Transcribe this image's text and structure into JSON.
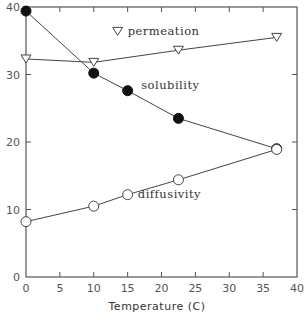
{
  "chart_data": {
    "type": "line",
    "title": "",
    "xlabel": "Temperature (C)",
    "ylabel": "",
    "xlim": [
      0,
      40
    ],
    "ylim": [
      0,
      40
    ],
    "xticks": [
      0,
      5,
      10,
      15,
      20,
      25,
      30,
      35,
      40
    ],
    "yticks": [
      0,
      10,
      20,
      30,
      40
    ],
    "grid": false,
    "legend": "inline labels",
    "series": [
      {
        "name": "permeation",
        "marker": "open-down-triangle",
        "x": [
          0,
          10,
          22.5,
          37
        ],
        "values": [
          32.3,
          31.8,
          33.6,
          35.5
        ],
        "label_pos": [
          15,
          35.8
        ]
      },
      {
        "name": "solubility",
        "marker": "filled-circle",
        "x": [
          0,
          10,
          15,
          22.5,
          37
        ],
        "values": [
          39.4,
          30.2,
          27.6,
          23.5,
          19.0
        ],
        "label_pos": [
          17,
          27.8
        ]
      },
      {
        "name": "diffusivity",
        "marker": "open-circle",
        "x": [
          0,
          10,
          15,
          22.5,
          37
        ],
        "values": [
          8.2,
          10.5,
          12.2,
          14.4,
          18.9
        ],
        "label_pos": [
          16.5,
          11.7
        ]
      }
    ]
  }
}
